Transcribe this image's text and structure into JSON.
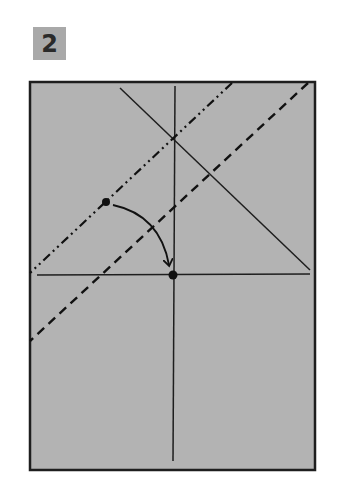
{
  "step": {
    "number": "2",
    "badge_color": "#a9a9a9"
  },
  "paper": {
    "fill_color": "#b3b3b3",
    "outline_color": "#1e1e1e",
    "rect": {
      "x": 30,
      "y": 82,
      "width": 285,
      "height": 388
    }
  },
  "creases": {
    "vertical_center": {
      "x1": 175,
      "y1": 86,
      "x2": 173,
      "y2": 461
    },
    "horizontal": {
      "x1": 37,
      "y1": 275,
      "x2": 310,
      "y2": 274
    },
    "diagonal_solid": {
      "x1": 120,
      "y1": 88,
      "x2": 310,
      "y2": 270
    }
  },
  "fold_lines": {
    "mountain_fold_dash_dot": {
      "x1": 232,
      "y1": 83,
      "x2": 30,
      "y2": 273,
      "style": "dash-dot"
    },
    "valley_fold_dashed": {
      "x1": 308,
      "y1": 83,
      "x2": 30,
      "y2": 341,
      "style": "dashed"
    }
  },
  "points": [
    {
      "name": "source-point",
      "x": 106,
      "y": 202
    },
    {
      "name": "target-point",
      "x": 173,
      "y": 275
    }
  ],
  "arrow": {
    "from": {
      "x": 113,
      "y": 205
    },
    "control": {
      "x": 160,
      "y": 215
    },
    "to": {
      "x": 169,
      "y": 265
    },
    "meaning": "fold source point onto target point"
  }
}
